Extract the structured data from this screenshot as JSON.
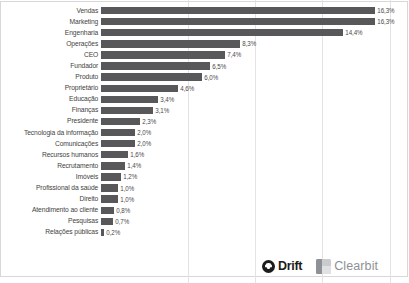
{
  "chart_data": {
    "type": "bar",
    "orientation": "horizontal",
    "title": "",
    "subtitle": "",
    "xlabel": "",
    "ylabel": "",
    "xlim": [
      0,
      17.5
    ],
    "grid": true,
    "gridline_values": [
      5,
      9,
      13,
      17
    ],
    "value_suffix": "%",
    "decimal_separator": ",",
    "bar_color": "#58585a",
    "label_color": "#3f3f41",
    "value_color": "#4a4a4c",
    "categories": [
      "Vendas",
      "Marketing",
      "Engenharia",
      "Operações",
      "CEO",
      "Fundador",
      "Produto",
      "Proprietário",
      "Educação",
      "Finanças",
      "Presidente",
      "Tecnologia da informação",
      "Comunicações",
      "Recursos humanos",
      "Recrutamento",
      "Imóveis",
      "Profissional da saúde",
      "Direito",
      "Atendimento ao cliente",
      "Pesquisas",
      "Relações públicas"
    ],
    "values": [
      16.3,
      16.3,
      14.4,
      8.3,
      7.4,
      6.5,
      6.0,
      4.6,
      3.4,
      3.1,
      2.3,
      2.0,
      2.0,
      1.6,
      1.4,
      1.2,
      1.0,
      1.0,
      0.8,
      0.7,
      0.2
    ],
    "value_labels": [
      "16,3%",
      "16,3%",
      "14,4%",
      "8,3%",
      "7,4%",
      "6,5%",
      "6,0%",
      "4,6%",
      "3,4%",
      "3,1%",
      "2,3%",
      "2,0%",
      "2,0%",
      "1,6%",
      "1,4%",
      "1,2%",
      "1,0%",
      "1,0%",
      "0,8%",
      "0,7%",
      "0,2%"
    ]
  },
  "logos": {
    "drift": {
      "name": "Drift",
      "mark": "drift-logo-icon"
    },
    "clearbit": {
      "name": "Clearbit",
      "mark": "clearbit-logo-icon"
    }
  }
}
